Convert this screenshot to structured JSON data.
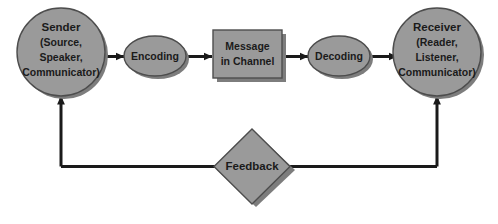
{
  "diagram": {
    "type": "flow-diagram",
    "colors": {
      "shape_fill": "#9a9a9a",
      "shape_stroke": "#4d4d4d",
      "shadow": "#7d7d7d",
      "line": "#1a1a1a",
      "text": "#1a1a1a",
      "background": "#ffffff"
    },
    "nodes": [
      {
        "id": "sender",
        "shape": "circle",
        "lines": [
          "Sender",
          "(Source,",
          "Speaker,",
          "Communicator)"
        ]
      },
      {
        "id": "encoding",
        "shape": "ellipse",
        "lines": [
          "Encoding"
        ]
      },
      {
        "id": "message",
        "shape": "rectangle",
        "lines": [
          "Message",
          "in Channel"
        ]
      },
      {
        "id": "decoding",
        "shape": "ellipse",
        "lines": [
          "Decoding"
        ]
      },
      {
        "id": "receiver",
        "shape": "circle",
        "lines": [
          "Receiver",
          "(Reader,",
          "Listener,",
          "Communicator)"
        ]
      },
      {
        "id": "feedback",
        "shape": "diamond",
        "lines": [
          "Feedback"
        ]
      }
    ],
    "edges": [
      {
        "from": "sender",
        "to": "encoding",
        "arrow": "right"
      },
      {
        "from": "encoding",
        "to": "message",
        "arrow": "right"
      },
      {
        "from": "message",
        "to": "decoding",
        "arrow": "right"
      },
      {
        "from": "decoding",
        "to": "receiver",
        "arrow": "right"
      },
      {
        "from": "receiver",
        "to": "feedback",
        "arrow": "none"
      },
      {
        "from": "feedback",
        "to": "sender",
        "arrow": "up"
      }
    ]
  }
}
